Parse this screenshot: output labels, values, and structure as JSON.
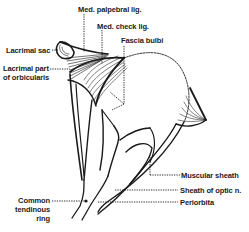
{
  "diagram": {
    "labels": {
      "med_palpebral_lig": "Med. palpebral lig.",
      "med_check_lig": "Med. check lig.",
      "fascia_bulbi": "Fascia bulbi",
      "lacrimal_sac": "Lacrimal sac",
      "lacrimal_part_line1": "Lacrimal part",
      "lacrimal_part_line2": "of orbicularis",
      "muscular_sheath": "Muscular sheath",
      "sheath_optic_n": "Sheath of optic n.",
      "periorbita": "Periorbita",
      "common_line1": "Common",
      "common_line2": "tendinous",
      "common_line3": "ring"
    },
    "colors": {
      "ink": "#1a1a1a",
      "background": "#ffffff"
    }
  }
}
